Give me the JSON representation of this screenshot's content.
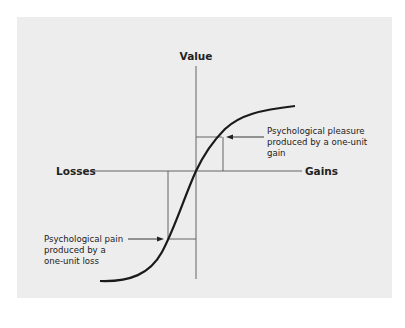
{
  "diagram": {
    "axes": {
      "y_label": "Value",
      "x_left_label": "Losses",
      "x_right_label": "Gains"
    },
    "annotations": {
      "gain": [
        "Psychological pleasure",
        "produced by a one-unit",
        "gain"
      ],
      "loss": [
        "Psychological pain",
        "produced by a",
        "one-unit loss"
      ]
    },
    "colors": {
      "panel_background": "#ededed",
      "page_background": "#ffffff",
      "curve": "#1a1a1a",
      "axis": "#555555"
    }
  }
}
